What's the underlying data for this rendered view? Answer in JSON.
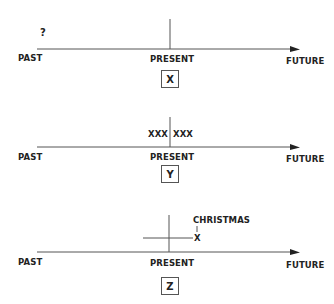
{
  "panels": [
    {
      "id": "X",
      "past_label": "PAST",
      "present_label": "PRESENT",
      "future_label": "FUTURE",
      "box_label": "X",
      "annotation": "?"
    },
    {
      "id": "Y",
      "past_label": "PAST",
      "present_label": "PRESENT",
      "future_label": "FUTURE",
      "box_label": "Y",
      "annotation_left": "XXX",
      "annotation_right": "XXX"
    },
    {
      "id": "Z",
      "past_label": "PAST",
      "present_label": "PRESENT",
      "future_label": "FUTURE",
      "box_label": "Z",
      "event_label": "CHRISTMAS",
      "event_marker": "X"
    }
  ],
  "colors": {
    "line": "#555555",
    "text": "#222222"
  }
}
